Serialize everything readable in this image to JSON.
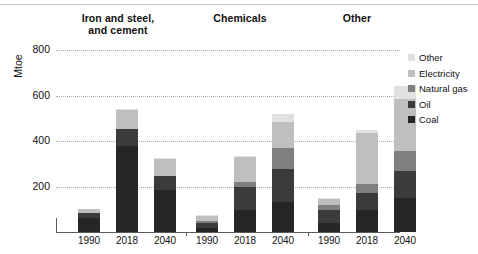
{
  "chart_data": {
    "type": "bar",
    "stacked": true,
    "title": "",
    "xlabel": "",
    "ylabel": "Mtoe",
    "ylim": [
      0,
      800
    ],
    "yticks": [
      200,
      400,
      600,
      800
    ],
    "grid": true,
    "legend_position": "right",
    "groups": [
      "Iron and steel, and cement",
      "Chemicals",
      "Other"
    ],
    "group_labels": [
      {
        "line1": "Iron and steel,",
        "line2": "and cement"
      },
      {
        "line1": "Chemicals",
        "line2": ""
      },
      {
        "line1": "Other",
        "line2": ""
      }
    ],
    "categories": [
      "1990",
      "2018",
      "2040"
    ],
    "series": [
      {
        "name": "Coal",
        "color": "#262626",
        "values": [
          [
            62,
            380,
            185
          ],
          [
            18,
            95,
            130
          ],
          [
            40,
            95,
            150
          ]
        ]
      },
      {
        "name": "Oil",
        "color": "#3b3b3b",
        "values": [
          [
            22,
            75,
            60
          ],
          [
            22,
            105,
            145
          ],
          [
            55,
            75,
            120
          ]
        ]
      },
      {
        "name": "Natural gas",
        "color": "#7f7f7f",
        "values": [
          [
            0,
            0,
            0
          ],
          [
            10,
            20,
            95
          ],
          [
            25,
            40,
            85
          ]
        ]
      },
      {
        "name": "Electricity",
        "color": "#bfbfbf",
        "values": [
          [
            16,
            80,
            75
          ],
          [
            20,
            110,
            115
          ],
          [
            25,
            225,
            230
          ]
        ]
      },
      {
        "name": "Other",
        "color": "#e0e0e0",
        "values": [
          [
            0,
            5,
            5
          ],
          [
            5,
            5,
            35
          ],
          [
            5,
            15,
            55
          ]
        ]
      }
    ],
    "totals": [
      [
        100,
        540,
        325
      ],
      [
        75,
        335,
        520
      ],
      [
        150,
        450,
        720
      ]
    ],
    "legend_entries": [
      "Other",
      "Electricity",
      "Natural gas",
      "Oil",
      "Coal"
    ],
    "units": "Mtoe"
  },
  "axis": {
    "y_title": "Mtoe",
    "y_ticks": [
      "800",
      "600",
      "400",
      "200"
    ]
  }
}
